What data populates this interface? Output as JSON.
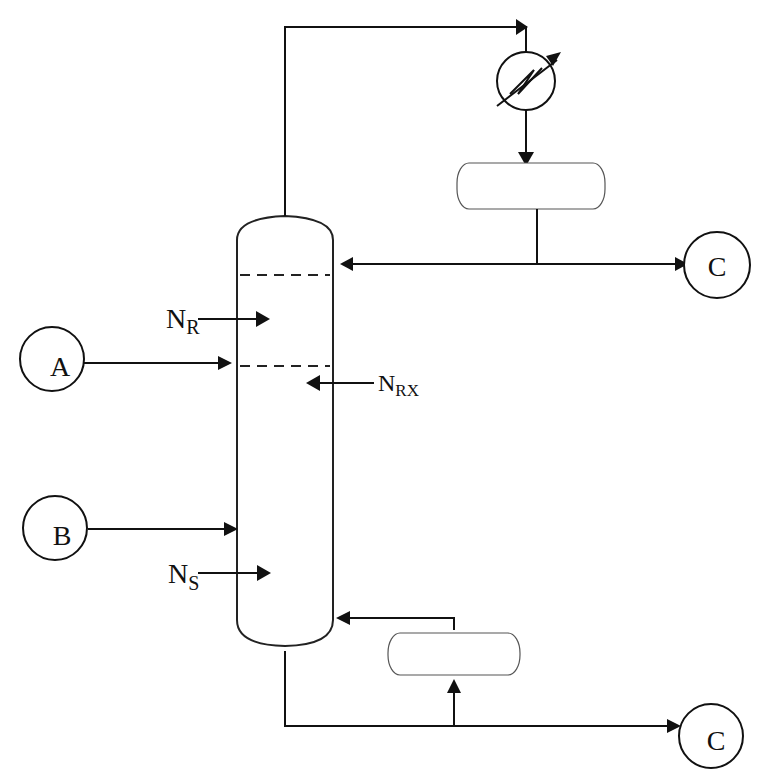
{
  "diagram": {
    "type": "process-flow-diagram",
    "nodes": {
      "feed_a": {
        "label": "A"
      },
      "feed_b": {
        "label": "B"
      },
      "product_top": {
        "label": "C"
      },
      "product_bottom": {
        "label": "C"
      }
    },
    "labels": {
      "n_r": {
        "main": "N",
        "sub": "R"
      },
      "n_rx": {
        "main": "N",
        "sub": "RX"
      },
      "n_s": {
        "main": "N",
        "sub": "S"
      }
    },
    "equipment": [
      {
        "id": "column",
        "kind": "distillation-column"
      },
      {
        "id": "condenser",
        "kind": "heat-exchanger"
      },
      {
        "id": "reflux-drum",
        "kind": "drum"
      },
      {
        "id": "reboiler",
        "kind": "drum"
      }
    ],
    "colors": {
      "line": "#111111",
      "background": "#ffffff"
    }
  }
}
